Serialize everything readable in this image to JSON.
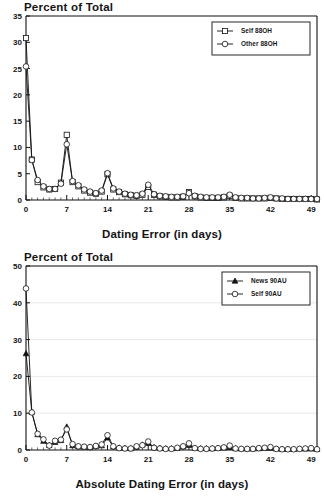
{
  "figure": {
    "panels": [
      {
        "id": "top",
        "title": "Percent of Total",
        "xlabel": "Dating Error (in days)"
      },
      {
        "id": "bottom",
        "title": "Percent of Total",
        "xlabel": "Absolute Dating Error (in days)"
      }
    ]
  },
  "chart_data": [
    {
      "type": "line",
      "title": "Percent of Total",
      "xlabel": "Dating Error (in days)",
      "ylabel": "Percent of Total",
      "xlim": [
        0,
        50
      ],
      "ylim": [
        0,
        35
      ],
      "yticks": [
        0,
        5,
        10,
        15,
        20,
        25,
        30,
        35
      ],
      "xticks": [
        0,
        7,
        14,
        21,
        28,
        35,
        42,
        49
      ],
      "grid": false,
      "legend_position": "top-right",
      "x": [
        0,
        1,
        2,
        3,
        4,
        5,
        6,
        7,
        8,
        9,
        10,
        11,
        12,
        13,
        14,
        15,
        16,
        17,
        18,
        19,
        20,
        21,
        22,
        23,
        24,
        25,
        26,
        27,
        28,
        29,
        30,
        31,
        32,
        33,
        34,
        35,
        36,
        37,
        38,
        39,
        40,
        41,
        42,
        43,
        44,
        45,
        46,
        47,
        48,
        49,
        50
      ],
      "series": [
        {
          "name": "Self 88OH",
          "marker": "square",
          "values": [
            30.8,
            7.7,
            3.4,
            2.4,
            2.0,
            2.1,
            3.3,
            12.4,
            3.4,
            2.6,
            1.8,
            1.4,
            1.2,
            1.6,
            4.9,
            2.0,
            1.5,
            1.1,
            0.9,
            0.8,
            1.0,
            2.5,
            1.0,
            0.7,
            0.6,
            0.5,
            0.5,
            0.6,
            1.5,
            0.7,
            0.5,
            0.4,
            0.4,
            0.4,
            0.5,
            0.8,
            0.4,
            0.3,
            0.3,
            0.3,
            0.3,
            0.3,
            0.4,
            0.3,
            0.2,
            0.2,
            0.2,
            0.2,
            0.2,
            0.2,
            0.1
          ]
        },
        {
          "name": "Other 88OH",
          "marker": "circle",
          "values": [
            25.4,
            7.6,
            3.8,
            2.6,
            2.1,
            2.1,
            3.1,
            10.6,
            3.6,
            2.8,
            2.0,
            1.6,
            1.3,
            1.8,
            5.1,
            2.2,
            1.6,
            1.2,
            1.0,
            0.9,
            1.2,
            2.9,
            1.1,
            0.8,
            0.7,
            0.6,
            0.6,
            0.7,
            1.3,
            0.8,
            0.6,
            0.5,
            0.5,
            0.5,
            0.6,
            1.0,
            0.5,
            0.4,
            0.4,
            0.3,
            0.3,
            0.4,
            0.5,
            0.3,
            0.3,
            0.2,
            0.2,
            0.2,
            0.2,
            0.2,
            0.2
          ]
        }
      ]
    },
    {
      "type": "line",
      "title": "Percent of Total",
      "xlabel": "Absolute Dating Error (in days)",
      "ylabel": "Percent of Total",
      "xlim": [
        0,
        50
      ],
      "ylim": [
        0,
        50
      ],
      "yticks": [
        0,
        10,
        20,
        30,
        40,
        50
      ],
      "xticks": [
        0,
        7,
        14,
        21,
        28,
        35,
        42,
        49
      ],
      "grid": true,
      "legend_position": "top-right",
      "x": [
        0,
        1,
        2,
        3,
        4,
        5,
        6,
        7,
        8,
        9,
        10,
        11,
        12,
        13,
        14,
        15,
        16,
        17,
        18,
        19,
        20,
        21,
        22,
        23,
        24,
        25,
        26,
        27,
        28,
        29,
        30,
        31,
        32,
        33,
        34,
        35,
        36,
        37,
        38,
        39,
        40,
        41,
        42,
        43,
        44,
        45,
        46,
        47,
        48,
        49,
        50
      ],
      "series": [
        {
          "name": "News 90AU",
          "marker": "triangle",
          "values": [
            26.2,
            10.3,
            4.2,
            2.4,
            1.3,
            2.1,
            2.6,
            6.3,
            1.2,
            0.9,
            0.8,
            0.7,
            1.0,
            1.2,
            3.3,
            0.9,
            0.6,
            0.5,
            0.4,
            0.8,
            1.4,
            1.8,
            0.7,
            0.5,
            0.4,
            0.4,
            0.5,
            0.9,
            1.3,
            0.5,
            0.4,
            0.4,
            0.4,
            0.5,
            0.6,
            0.7,
            0.4,
            0.3,
            0.3,
            0.3,
            0.4,
            0.5,
            0.5,
            0.3,
            0.2,
            0.2,
            0.2,
            0.3,
            0.3,
            0.3,
            0.2
          ]
        },
        {
          "name": "Self 90AU",
          "marker": "circle",
          "values": [
            43.9,
            10.2,
            4.4,
            2.9,
            1.2,
            2.5,
            2.8,
            5.6,
            1.6,
            1.0,
            0.9,
            0.8,
            1.1,
            1.5,
            4.0,
            1.0,
            0.5,
            0.4,
            0.4,
            1.0,
            1.3,
            2.3,
            0.6,
            0.4,
            0.3,
            0.3,
            0.6,
            1.0,
            1.8,
            0.5,
            0.3,
            0.3,
            0.4,
            0.5,
            0.7,
            1.2,
            0.4,
            0.3,
            0.3,
            0.3,
            0.5,
            0.6,
            0.8,
            0.3,
            0.2,
            0.2,
            0.2,
            0.3,
            0.4,
            0.5,
            0.2
          ]
        }
      ]
    }
  ]
}
